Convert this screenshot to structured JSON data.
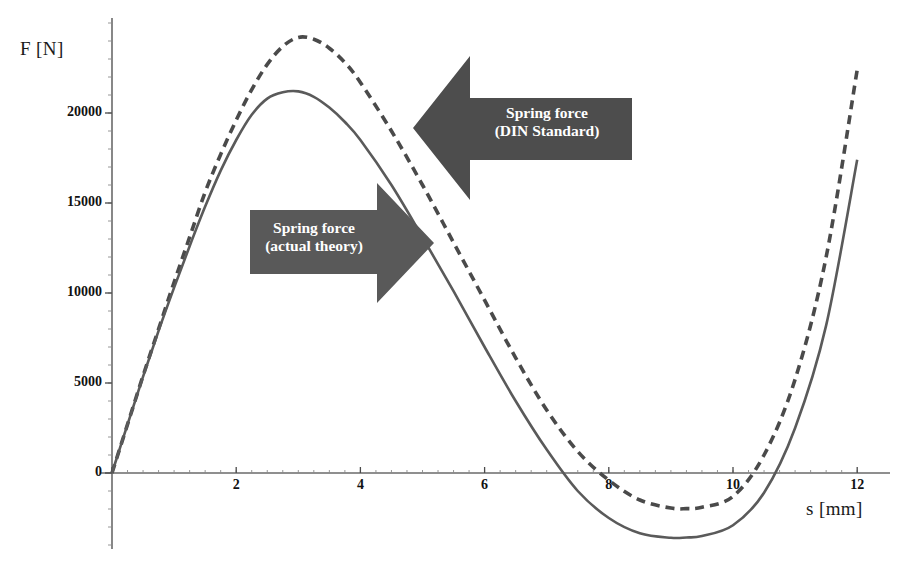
{
  "chart_data": {
    "type": "line",
    "title": "",
    "xlabel": "s [mm]",
    "ylabel": "F [N]",
    "xlim": [
      0,
      12.2
    ],
    "ylim": [
      -5000,
      25000
    ],
    "grid": false,
    "legend_position": "annotations",
    "x_ticks": [
      0,
      2,
      4,
      6,
      8,
      10,
      12
    ],
    "x_tick_labels": [
      "0",
      "2",
      "4",
      "6",
      "8",
      "10",
      "12"
    ],
    "y_ticks": [
      0,
      5000,
      10000,
      15000,
      20000
    ],
    "y_tick_labels": [
      "0",
      "5000",
      "10000",
      "15000",
      "20000"
    ],
    "x_minor_tick_step": 0.25,
    "y_minor_tick_step": 1000,
    "series": [
      {
        "name": "Spring force (DIN Standard)",
        "style": "dashed",
        "color": "#4a4a4a",
        "x": [
          0,
          0.25,
          0.5,
          0.75,
          1,
          1.25,
          1.5,
          1.75,
          2,
          2.25,
          2.5,
          2.75,
          3,
          3.25,
          3.5,
          3.75,
          4,
          4.5,
          5,
          5.5,
          6,
          6.5,
          7,
          7.5,
          8,
          8.5,
          9,
          9.25,
          9.5,
          10,
          10.5,
          11,
          11.5,
          12
        ],
        "y": [
          0,
          2700,
          5400,
          8000,
          10600,
          13100,
          15600,
          17700,
          19600,
          21300,
          22700,
          23700,
          24200,
          24100,
          23600,
          22800,
          21700,
          19000,
          16000,
          12800,
          9600,
          6400,
          3500,
          1200,
          -400,
          -1500,
          -1950,
          -1980,
          -1900,
          -1300,
          1000,
          5200,
          12000,
          22400
        ]
      },
      {
        "name": "Spring force (actual theory)",
        "style": "solid",
        "color": "#5a5a5a",
        "x": [
          0,
          0.25,
          0.5,
          0.75,
          1,
          1.25,
          1.5,
          1.75,
          2,
          2.25,
          2.5,
          2.75,
          3,
          3.25,
          3.5,
          3.75,
          4,
          4.5,
          5,
          5.5,
          6,
          6.5,
          7,
          7.5,
          8,
          8.5,
          9,
          9.25,
          9.5,
          10,
          10.5,
          11,
          11.5,
          12
        ],
        "y": [
          0,
          2700,
          5350,
          7900,
          10300,
          12600,
          14800,
          16800,
          18500,
          19900,
          20800,
          21150,
          21200,
          20900,
          20300,
          19500,
          18500,
          16000,
          13100,
          10100,
          7000,
          4000,
          1300,
          -1000,
          -2500,
          -3350,
          -3600,
          -3580,
          -3500,
          -2900,
          -1100,
          2500,
          8200,
          17400
        ]
      }
    ],
    "annotations": [
      {
        "name": "din-standard-callout",
        "line1": "Spring force",
        "line2": "(DIN Standard)",
        "direction": "left",
        "fill": "#4d4d4d",
        "text_color": "#ffffff"
      },
      {
        "name": "actual-theory-callout",
        "line1": "Spring force",
        "line2": "(actual theory)",
        "direction": "right",
        "fill": "#595959",
        "text_color": "#ffffff"
      }
    ],
    "colors": {
      "axis": "#6a6a6a",
      "tick_text": "#111111",
      "background": "#ffffff"
    }
  }
}
